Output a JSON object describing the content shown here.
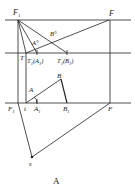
{
  "caption": "A",
  "labels": {
    "F1": "F",
    "F1_sub": "1",
    "F": "F",
    "A0": "A°",
    "B0": "B°",
    "T": "T",
    "T1A1": "T",
    "T1A1_sub": "1",
    "T1A1_paren": "(A",
    "T1A1_paren_sub": "1",
    "T1A1_close": ")",
    "T1B1": "T",
    "T1B1_sub": "1",
    "T1B1_paren": "(B",
    "T1B1_paren_sub": "1",
    "T1B1_close": ")",
    "B": "B",
    "A": "A",
    "F1_bottom": "F",
    "F1_bottom_sub": "1",
    "t": "t",
    "A1": "A",
    "A1_sub": "1",
    "B1": "B",
    "B1_sub": "1",
    "F_bottom": "F",
    "s": "s"
  },
  "colors": {
    "line": "#222222",
    "background": "#ffffff"
  }
}
